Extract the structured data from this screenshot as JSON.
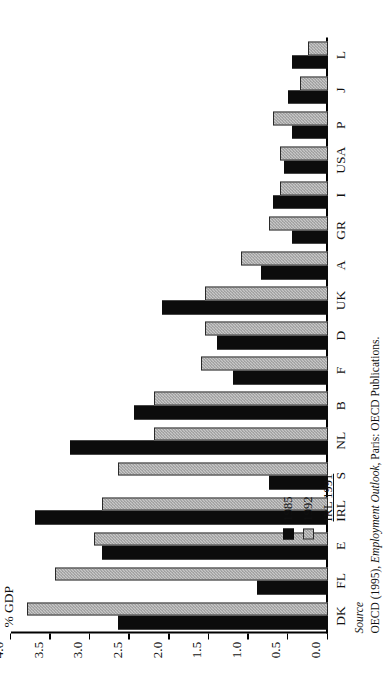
{
  "chart_data": {
    "type": "bar",
    "orientation": "horizontal",
    "title": "",
    "xlabel": "",
    "ylabel": "% GDP",
    "ylim": [
      0.0,
      4.0
    ],
    "ytick_labels": [
      "4.0",
      "3.5",
      "3.0",
      "2.5",
      "2.0",
      "1.5",
      "1.0",
      "0.5",
      "0.0"
    ],
    "ytick_values": [
      4.0,
      3.5,
      3.0,
      2.5,
      2.0,
      1.5,
      1.0,
      0.5,
      0.0
    ],
    "grid": false,
    "legend_position": "top-left",
    "categories": [
      "DK",
      "FL",
      "E",
      "IRL",
      "S",
      "NL",
      "B",
      "F",
      "D",
      "UK",
      "A",
      "GR",
      "I",
      "USA",
      "P",
      "J",
      "L"
    ],
    "series": [
      {
        "name": "1985",
        "color": "#0c0c0c",
        "values": [
          2.65,
          0.9,
          2.85,
          3.7,
          0.75,
          3.25,
          2.45,
          1.2,
          1.4,
          2.1,
          0.85,
          0.45,
          0.7,
          0.55,
          0.45,
          0.5,
          0.45
        ]
      },
      {
        "name": "1992",
        "color": "#c8c8c8",
        "values": [
          3.8,
          3.45,
          2.95,
          2.85,
          2.65,
          2.2,
          2.2,
          1.6,
          1.55,
          1.55,
          1.1,
          0.75,
          0.6,
          0.6,
          0.7,
          0.35,
          0.25
        ]
      }
    ]
  },
  "legend": {
    "items": [
      {
        "label": "1985",
        "swatch": "black",
        "underline": false
      },
      {
        "label": "1992",
        "swatch": "gray",
        "underline": false
      },
      {
        "label": "IRL 1991",
        "swatch": "none",
        "underline": true
      }
    ]
  },
  "source": {
    "heading": "Source",
    "prefix": "OECD (1995), ",
    "italic_title": "Employment Outlook",
    "suffix": ", Paris: OECD Publications."
  }
}
